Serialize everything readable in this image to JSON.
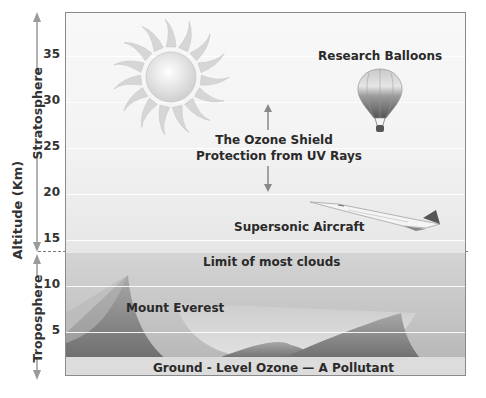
{
  "diagram": {
    "title_axis": "Altitude (Km)",
    "layers": {
      "stratosphere": "Stratosphere",
      "troposphere": "Troposphere"
    },
    "ticks": [
      "35",
      "30",
      "25",
      "20",
      "15",
      "10",
      "5"
    ],
    "labels": {
      "balloons": "Research Balloons",
      "ozone_line1": "The Ozone Shield",
      "ozone_line2": "Protection from UV Rays",
      "aircraft": "Supersonic Aircraft",
      "clouds": "Limit of most clouds",
      "everest": "Mount Everest",
      "ground": "Ground - Level Ozone — A Pollutant"
    },
    "icons": [
      "sun-icon",
      "balloon-icon",
      "aircraft-icon",
      "mountain-icon",
      "double-arrow-icon"
    ],
    "colors": {
      "background": "#ffffff",
      "text": "#2a2a2a",
      "border": "#8a8a8a",
      "dash": "#777777"
    }
  }
}
